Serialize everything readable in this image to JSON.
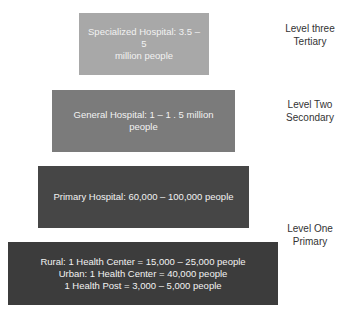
{
  "diagram": {
    "type": "healthcare-tier-pyramid",
    "tiers": [
      {
        "id": "specialized",
        "lines": [
          "Specialized Hospital: 3.5 – 5",
          "million people"
        ],
        "color": "#a8a8a8"
      },
      {
        "id": "general",
        "lines": [
          "General Hospital: 1 – 1 . 5 million people"
        ],
        "color": "#7b7b7b"
      },
      {
        "id": "primary-hospital",
        "lines": [
          "Primary Hospital: 60,000 – 100,000 people"
        ],
        "color": "#464646"
      },
      {
        "id": "health-center",
        "lines": [
          "Rural: 1 Health Center = 15,000 – 25,000 people",
          "Urban: 1 Health Center = 40,000 people",
          "1 Health Post = 3,000 – 5,000 people"
        ],
        "color": "#3c3c3c"
      }
    ],
    "levels": [
      {
        "line1": "Level three",
        "line2": "Tertiary"
      },
      {
        "line1": "Level Two",
        "line2": "Secondary"
      },
      {
        "line1": "Level One",
        "line2": "Primary"
      }
    ]
  }
}
